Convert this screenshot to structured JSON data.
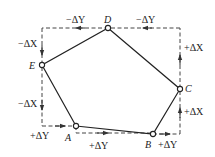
{
  "diagram": {
    "title": "",
    "colors": {
      "stroke": "#222222",
      "dash": "#444444",
      "background": "#ffffff"
    },
    "points": [
      {
        "id": "A",
        "label": "A",
        "x": 76,
        "y": 126
      },
      {
        "id": "B",
        "label": "B",
        "x": 153,
        "y": 134
      },
      {
        "id": "C",
        "label": "C",
        "x": 180,
        "y": 89
      },
      {
        "id": "D",
        "label": "D",
        "x": 108,
        "y": 28
      },
      {
        "id": "E",
        "label": "E",
        "x": 42,
        "y": 65
      }
    ],
    "polygon_order": [
      "A",
      "B",
      "C",
      "D",
      "E"
    ],
    "increment_labels": {
      "top_right": "−ΔY",
      "top_left": "−ΔY",
      "left_upper": "−ΔX",
      "left_lower": "−ΔX",
      "bottom_left": "+ΔY",
      "bottom_middle": "+ΔY",
      "bottom_right": "+ΔY",
      "right_lower": "+ΔX",
      "right_upper": "+ΔX"
    }
  }
}
